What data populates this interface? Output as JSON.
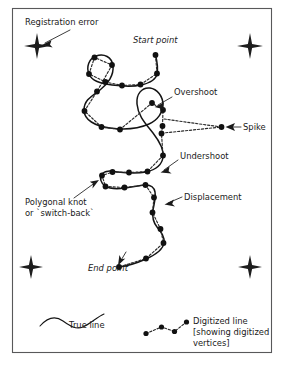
{
  "figure": {
    "type": "diagram",
    "background_color": "#ffffff",
    "frame_color": "#58585a",
    "ink_color": "#1a1a1a"
  },
  "annotations": {
    "registration_error": "Registration error",
    "start_point": "Start point",
    "overshoot": "Overshoot",
    "spike": "Spike",
    "undershoot": "Undershoot",
    "displacement": "Displacement",
    "polygonal_knot_line1": "Polygonal knot",
    "polygonal_knot_line2": "or `switch-back`",
    "end_point": "End point"
  },
  "legend": {
    "true_line_label": "True line",
    "digitized_line_line1": "Digitized line",
    "digitized_line_line2": "[showing digitized",
    "digitized_line_line3": "vertices]"
  },
  "registration_marks": {
    "count": 4,
    "glyph": "four-point-star-cross",
    "positions": [
      {
        "name": "top-left",
        "x": 37,
        "y": 46
      },
      {
        "name": "top-right",
        "x": 250,
        "y": 46
      },
      {
        "name": "bottom-left",
        "x": 31,
        "y": 267
      },
      {
        "name": "bottom-right",
        "x": 250,
        "y": 267
      }
    ]
  },
  "true_line_path": "M 155.5,55 C 157.5,63 158,69 157,74 C 156,80 150,83 141,85 C 132,87 120,86 112,85 C 100,83.5 92,81 89,74 C 86,67 89,58.5 96,56 C 104,53 112,57 113,66 C 114,75 108,84 100,90 C 92,96 84,100 84,110 C 84,120 95,126 110,128 C 125,130 140,128 149,124 C 158,120 163,112 163,105 C 163,96 157,89 150,88 C 142,87 136,94 137,104 C 138,116 146,124 153,133 C 160,142 164,150 163,157 C 162,165 155,170 146,172 C 136,174 126,173 118,172 C 111,171 105,170 102,174 C 99,178 101,183 105,186 C 110,189 118,189 125,188 C 134,187 141,185 146,185 C 151,185 154,187 155,192 C 156,198 154,204 153,210 C 152,217 153,222 157,227 C 161,232 165,237 164,243 C 163,250 155,255 146,259 C 137,263 127,266 119,267",
  "digitized_vertices": [
    {
      "x": 155.5,
      "y": 55
    },
    {
      "x": 157.0,
      "y": 73.5
    },
    {
      "x": 140.5,
      "y": 84.5
    },
    {
      "x": 122.0,
      "y": 85.5
    },
    {
      "x": 105.5,
      "y": 82.0
    },
    {
      "x": 89.0,
      "y": 74.0
    },
    {
      "x": 94.5,
      "y": 57.5
    },
    {
      "x": 112.0,
      "y": 65.0
    },
    {
      "x": 97.0,
      "y": 91.5
    },
    {
      "x": 84.5,
      "y": 111.0
    },
    {
      "x": 101.5,
      "y": 127.0
    },
    {
      "x": 120.0,
      "y": 129.5
    },
    {
      "x": 152.0,
      "y": 103.0
    },
    {
      "x": 163.0,
      "y": 110.0
    },
    {
      "x": 162.5,
      "y": 126.0
    },
    {
      "x": 161.5,
      "y": 133.5
    },
    {
      "x": 163.0,
      "y": 155.5
    },
    {
      "x": 147.5,
      "y": 171.5
    },
    {
      "x": 129.0,
      "y": 172.5
    },
    {
      "x": 112.5,
      "y": 172.0
    },
    {
      "x": 102.0,
      "y": 175.5
    },
    {
      "x": 105.5,
      "y": 186.5
    },
    {
      "x": 124.5,
      "y": 187.5
    },
    {
      "x": 145.5,
      "y": 185.0
    },
    {
      "x": 154.0,
      "y": 197.5
    },
    {
      "x": 152.5,
      "y": 212.5
    },
    {
      "x": 160.5,
      "y": 229.0
    },
    {
      "x": 163.5,
      "y": 243.0
    },
    {
      "x": 146.0,
      "y": 258.5
    },
    {
      "x": 119.0,
      "y": 267.0
    }
  ],
  "spike": {
    "tip": {
      "x": 221.5,
      "y": 127.0
    },
    "base_upper": {
      "x": 164.0,
      "y": 119.0
    },
    "base_lower": {
      "x": 163.5,
      "y": 133.0
    }
  },
  "legend_vertices": [
    {
      "x": 146.0,
      "y": 333.5
    },
    {
      "x": 161.5,
      "y": 327.0
    },
    {
      "x": 174.5,
      "y": 331.5
    },
    {
      "x": 186.5,
      "y": 322.0
    }
  ],
  "legend_true_line_path": "M 40,326 C 48,317 56,316 63,321 C 70,326 76,330 83,327 C 90,324 97,317 104,314"
}
